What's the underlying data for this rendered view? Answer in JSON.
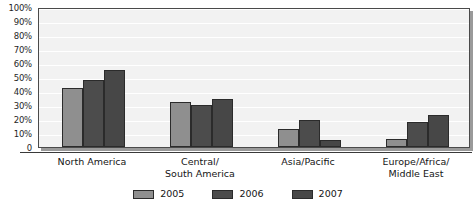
{
  "chart_data": {
    "type": "bar",
    "title": "",
    "subtitle": "",
    "xlabel": "",
    "ylabel": "",
    "ylim": [
      0,
      100
    ],
    "grid": true,
    "legend_position": "bottom",
    "categories": [
      "North America",
      "Central/\nSouth America",
      "Asia/Pacific",
      "Europe/Africa/\nMiddle East"
    ],
    "y_ticks": [
      "0",
      "10%",
      "20%",
      "30%",
      "40%",
      "50%",
      "60%",
      "70%",
      "80%",
      "90%",
      "100%"
    ],
    "y_tick_values": [
      0,
      10,
      20,
      30,
      40,
      50,
      60,
      70,
      80,
      90,
      100
    ],
    "series": [
      {
        "name": "2005",
        "color": "#8f8f8f",
        "values": [
          42,
          32,
          13,
          6
        ]
      },
      {
        "name": "2006",
        "color": "#4c4c4c",
        "values": [
          48,
          30,
          19,
          18
        ]
      },
      {
        "name": "2007",
        "color": "#474747",
        "values": [
          55,
          34,
          5,
          23
        ]
      }
    ]
  },
  "legend": {
    "items": [
      {
        "label": "2005",
        "color": "#8f8f8f"
      },
      {
        "label": "2006",
        "color": "#4c4c4c"
      },
      {
        "label": "2007",
        "color": "#474747"
      }
    ]
  }
}
